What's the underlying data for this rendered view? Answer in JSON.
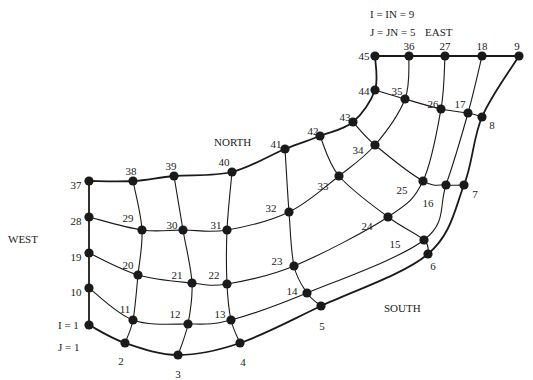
{
  "title_lines": [
    "I = IN = 9",
    "J = JN = 5"
  ],
  "regions": {
    "east": "EAST",
    "north": "NORTH",
    "west": "WEST",
    "south": "SOUTH"
  },
  "origin_labels": {
    "i": "I = 1",
    "j": "J = 1"
  },
  "grid": {
    "IN": 9,
    "JN": 5
  },
  "nodes": [
    {
      "id": 1,
      "x": 89,
      "y": 325,
      "label": ""
    },
    {
      "id": 2,
      "x": 125,
      "y": 343,
      "label": "2",
      "lx": 121,
      "ly": 361
    },
    {
      "id": 3,
      "x": 178,
      "y": 355,
      "label": "3",
      "lx": 178,
      "ly": 374
    },
    {
      "id": 4,
      "x": 240,
      "y": 343,
      "label": "4",
      "lx": 243,
      "ly": 362
    },
    {
      "id": 5,
      "x": 321,
      "y": 306,
      "label": "5",
      "lx": 322,
      "ly": 326
    },
    {
      "id": 6,
      "x": 428,
      "y": 254,
      "label": "6",
      "lx": 433,
      "ly": 266
    },
    {
      "id": 7,
      "x": 464,
      "y": 185,
      "label": "7",
      "lx": 475,
      "ly": 194
    },
    {
      "id": 8,
      "x": 482,
      "y": 117,
      "label": "8",
      "lx": 492,
      "ly": 125
    },
    {
      "id": 9,
      "x": 519,
      "y": 56,
      "label": "9",
      "lx": 517,
      "ly": 46
    },
    {
      "id": 10,
      "x": 89,
      "y": 288,
      "label": "10",
      "lx": 76,
      "ly": 292
    },
    {
      "id": 11,
      "x": 133,
      "y": 320,
      "label": "11",
      "lx": 125,
      "ly": 309
    },
    {
      "id": 12,
      "x": 188,
      "y": 324,
      "label": "12",
      "lx": 175,
      "ly": 314
    },
    {
      "id": 13,
      "x": 231,
      "y": 320,
      "label": "13",
      "lx": 220,
      "ly": 314
    },
    {
      "id": 14,
      "x": 307,
      "y": 293,
      "label": "14",
      "lx": 292,
      "ly": 291
    },
    {
      "id": 15,
      "x": 424,
      "y": 240,
      "label": "15",
      "lx": 395,
      "ly": 244
    },
    {
      "id": 16,
      "x": 446,
      "y": 185,
      "label": "16",
      "lx": 428,
      "ly": 203
    },
    {
      "id": 17,
      "x": 468,
      "y": 113,
      "label": "17",
      "lx": 460,
      "ly": 104
    },
    {
      "id": 18,
      "x": 482,
      "y": 56,
      "label": "18",
      "lx": 482,
      "ly": 46
    },
    {
      "id": 19,
      "x": 89,
      "y": 253,
      "label": "19",
      "lx": 76,
      "ly": 257
    },
    {
      "id": 20,
      "x": 138,
      "y": 275,
      "label": "20",
      "lx": 128,
      "ly": 265
    },
    {
      "id": 21,
      "x": 192,
      "y": 283,
      "label": "21",
      "lx": 177,
      "ly": 275
    },
    {
      "id": 22,
      "x": 227,
      "y": 284,
      "label": "22",
      "lx": 214,
      "ly": 275
    },
    {
      "id": 23,
      "x": 294,
      "y": 266,
      "label": "23",
      "lx": 277,
      "ly": 261
    },
    {
      "id": 24,
      "x": 388,
      "y": 217,
      "label": "24",
      "lx": 367,
      "ly": 226
    },
    {
      "id": 25,
      "x": 423,
      "y": 181,
      "label": "25",
      "lx": 402,
      "ly": 190
    },
    {
      "id": 26,
      "x": 441,
      "y": 109,
      "label": "26",
      "lx": 433,
      "ly": 104
    },
    {
      "id": 27,
      "x": 445,
      "y": 56,
      "label": "27",
      "lx": 445,
      "ly": 46
    },
    {
      "id": 28,
      "x": 89,
      "y": 217,
      "label": "28",
      "lx": 76,
      "ly": 221
    },
    {
      "id": 29,
      "x": 142,
      "y": 230,
      "label": "29",
      "lx": 128,
      "ly": 218
    },
    {
      "id": 30,
      "x": 183,
      "y": 230,
      "label": "30",
      "lx": 172,
      "ly": 225
    },
    {
      "id": 31,
      "x": 227,
      "y": 230,
      "label": "31",
      "lx": 216,
      "ly": 225
    },
    {
      "id": 32,
      "x": 289,
      "y": 212,
      "label": "32",
      "lx": 271,
      "ly": 208
    },
    {
      "id": 33,
      "x": 339,
      "y": 176,
      "label": "33",
      "lx": 323,
      "ly": 186
    },
    {
      "id": 34,
      "x": 375,
      "y": 145,
      "label": "34",
      "lx": 358,
      "ly": 150
    },
    {
      "id": 35,
      "x": 405,
      "y": 99,
      "label": "35",
      "lx": 397,
      "ly": 91
    },
    {
      "id": 36,
      "x": 409,
      "y": 56,
      "label": "36",
      "lx": 409,
      "ly": 46
    },
    {
      "id": 37,
      "x": 89,
      "y": 181,
      "label": "37",
      "lx": 76,
      "ly": 185
    },
    {
      "id": 38,
      "x": 133,
      "y": 181,
      "label": "38",
      "lx": 131,
      "ly": 171
    },
    {
      "id": 39,
      "x": 174,
      "y": 176,
      "label": "39",
      "lx": 171,
      "ly": 166
    },
    {
      "id": 40,
      "x": 232,
      "y": 172,
      "label": "40",
      "lx": 224,
      "ly": 162
    },
    {
      "id": 41,
      "x": 285,
      "y": 149,
      "label": "41",
      "lx": 276,
      "ly": 144
    },
    {
      "id": 42,
      "x": 320,
      "y": 136,
      "label": "42",
      "lx": 313,
      "ly": 131
    },
    {
      "id": 43,
      "x": 353,
      "y": 122,
      "label": "43",
      "lx": 345,
      "ly": 117
    },
    {
      "id": 44,
      "x": 375,
      "y": 90,
      "label": "44",
      "lx": 364,
      "ly": 91
    },
    {
      "id": 45,
      "x": 375,
      "y": 56,
      "label": "45",
      "lx": 364,
      "ly": 56
    }
  ]
}
